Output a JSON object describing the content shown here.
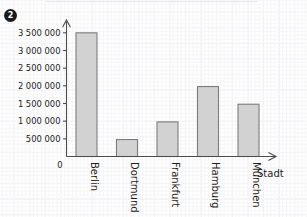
{
  "exercise": {
    "number": "2"
  },
  "chart_data": {
    "type": "bar",
    "title": "",
    "xlabel": "Stadt",
    "ylabel": "",
    "categories": [
      "Berlin",
      "Dortmund",
      "Frankfurt",
      "Hamburg",
      "München"
    ],
    "values": [
      3500000,
      480000,
      980000,
      1980000,
      1480000
    ],
    "ylim": [
      0,
      3750000
    ],
    "yticks": [
      500000,
      1000000,
      1500000,
      2000000,
      2500000,
      3000000,
      3500000
    ],
    "ytick_labels": [
      "500 000",
      "1 000 000",
      "1 500 000",
      "2 000 000",
      "2 500 000",
      "3 000 000",
      "3 500 000"
    ],
    "origin_label": "0",
    "grid": true,
    "grid_style": "graph-paper",
    "legend": false,
    "category_label_rotation": -90,
    "bar_fill": "#d2d2d2",
    "bar_stroke": "#7c7c7c",
    "axis_color": "#4c4c4c",
    "grid_color": "#ededf0",
    "y_axis_arrow": true,
    "x_axis_arrow": true
  }
}
